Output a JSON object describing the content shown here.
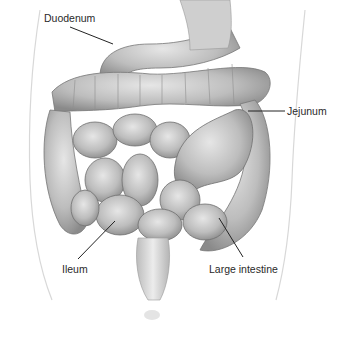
{
  "diagram": {
    "type": "anatomical-illustration",
    "labels": [
      {
        "id": "duodenum",
        "text": "Duodenum",
        "x": 44,
        "y": 12,
        "line": [
          70,
          27,
          113,
          44
        ]
      },
      {
        "id": "jejunum",
        "text": "Jejunum",
        "x": 287,
        "y": 105,
        "line": [
          248,
          111,
          285,
          111
        ]
      },
      {
        "id": "ileum",
        "text": "Ileum",
        "x": 62,
        "y": 263,
        "line": [
          78,
          259,
          115,
          221
        ]
      },
      {
        "id": "large-intestine",
        "text": "Large intestine",
        "x": 209,
        "y": 263,
        "line": [
          243,
          257,
          219,
          218
        ]
      }
    ]
  }
}
